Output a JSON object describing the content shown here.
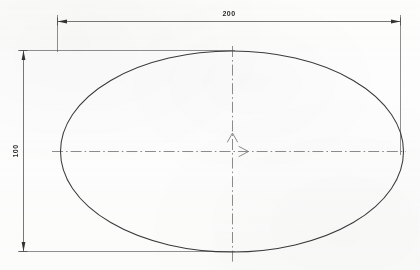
{
  "drawing": {
    "title": "ellipse-dimensioned-drawing",
    "background_color": "#fdfdfd",
    "line_color": "#3a3a3a",
    "dim_line_color": "#555555",
    "center_line_color": "#777777",
    "text_color": "#2a2a2a"
  },
  "shape": {
    "type": "ellipse",
    "center_x": 232,
    "center_y": 151,
    "semi_major_x": 172,
    "semi_minor_y": 100
  },
  "dimensions": {
    "width": {
      "label": "200",
      "orientation": "horizontal",
      "position": "top"
    },
    "height": {
      "label": "100",
      "orientation": "vertical",
      "position": "left"
    }
  },
  "axes": {
    "x_axis": {
      "name": "x-axis-centerline",
      "arrow_direction": "right",
      "style": "dash-dot"
    },
    "y_axis": {
      "name": "y-axis-centerline",
      "arrow_direction": "up",
      "style": "dash-dot"
    },
    "origin_marker": "center-origin"
  }
}
